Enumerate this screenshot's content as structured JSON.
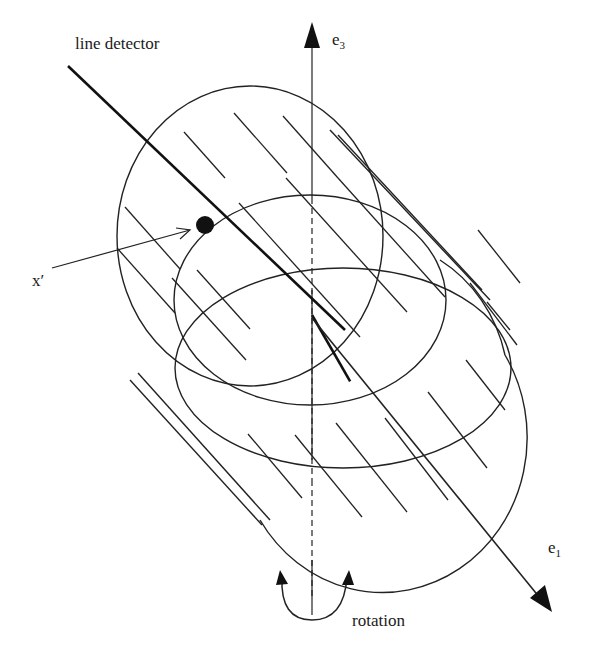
{
  "diagram": {
    "labels": {
      "line_detector": "line detector",
      "e3_base": "e",
      "e3_sub": "3",
      "e1_base": "e",
      "e1_sub": "1",
      "x_prime": "x′",
      "rotation": "rotation"
    },
    "colors": {
      "ink": "#222222",
      "background": "#ffffff"
    },
    "elements": [
      {
        "id": "line-detector",
        "kind": "thick line",
        "from": [
          68,
          68
        ],
        "to": [
          345,
          330
        ]
      },
      {
        "id": "e3-axis",
        "kind": "arrow up",
        "x": 312,
        "from_y": 600,
        "to_y": 22
      },
      {
        "id": "e1-axis",
        "kind": "arrow down-right",
        "from": [
          312,
          318
        ],
        "to": [
          550,
          612
        ]
      },
      {
        "id": "point-x-prime",
        "kind": "filled dot",
        "at": [
          205,
          225
        ]
      },
      {
        "id": "rotation-arrow",
        "kind": "double curved arrow",
        "center": [
          312,
          600
        ]
      }
    ]
  }
}
